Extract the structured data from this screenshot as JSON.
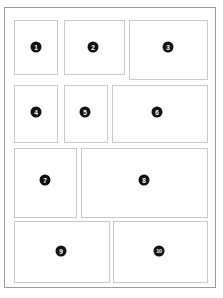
{
  "document": {
    "title": "Grid Layout Wireframe",
    "type": "wireframe",
    "background_color": "#ffffff"
  },
  "frame": {
    "name": "page-frame",
    "border_color": "#9a9a9a",
    "fill_color": "#ffffff",
    "x": 4,
    "y": 7,
    "width": 212,
    "height": 281
  },
  "style": {
    "panel_border_color": "#c9c9c9",
    "panel_fill_color": "#fefefe",
    "badge_fill_color": "#111111",
    "badge_text_color": "#ffffff",
    "badge_diameter": 11
  },
  "panels": [
    {
      "number": "1",
      "label": "1",
      "row": 1,
      "x": 14,
      "y": 20,
      "width": 44,
      "height": 55,
      "badge_x": 36,
      "badge_y": 47
    },
    {
      "number": "2",
      "label": "2",
      "row": 1,
      "x": 64,
      "y": 20,
      "width": 61,
      "height": 55,
      "badge_x": 93,
      "badge_y": 47
    },
    {
      "number": "3",
      "label": "3",
      "row": 1,
      "x": 129,
      "y": 20,
      "width": 79,
      "height": 60,
      "badge_x": 168,
      "badge_y": 47
    },
    {
      "number": "4",
      "label": "4",
      "row": 2,
      "x": 14,
      "y": 85,
      "width": 44,
      "height": 58,
      "badge_x": 36,
      "badge_y": 112
    },
    {
      "number": "5",
      "label": "5",
      "row": 2,
      "x": 64,
      "y": 85,
      "width": 44,
      "height": 58,
      "badge_x": 85,
      "badge_y": 112
    },
    {
      "number": "6",
      "label": "6",
      "row": 2,
      "x": 112,
      "y": 85,
      "width": 96,
      "height": 58,
      "badge_x": 157,
      "badge_y": 112
    },
    {
      "number": "7",
      "label": "7",
      "row": 3,
      "x": 14,
      "y": 148,
      "width": 63,
      "height": 70,
      "badge_x": 45,
      "badge_y": 180
    },
    {
      "number": "8",
      "label": "8",
      "row": 3,
      "x": 81,
      "y": 148,
      "width": 127,
      "height": 70,
      "badge_x": 144,
      "badge_y": 180
    },
    {
      "number": "9",
      "label": "9",
      "row": 4,
      "x": 14,
      "y": 221,
      "width": 96,
      "height": 62,
      "badge_x": 61,
      "badge_y": 251
    },
    {
      "number": "10",
      "label": "10",
      "row": 4,
      "x": 113,
      "y": 221,
      "width": 95,
      "height": 62,
      "badge_x": 159,
      "badge_y": 251
    }
  ]
}
